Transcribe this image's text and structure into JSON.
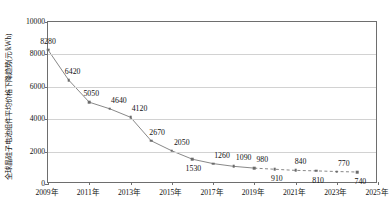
{
  "chart_data": {
    "type": "line",
    "title": "",
    "xlabel": "",
    "ylabel": "全球晶硅子电池组件平均价格下降趋势(元/kWh)",
    "ylim": [
      0,
      10000
    ],
    "xlim": [
      2009,
      2025
    ],
    "grid": true,
    "legend": "none",
    "y_ticks": [
      "0",
      "2000",
      "4000",
      "6000",
      "8000",
      "10000"
    ],
    "y_tick_values": [
      0,
      2000,
      4000,
      6000,
      8000,
      10000
    ],
    "x_ticks": [
      "2009年",
      "2011年",
      "2013年",
      "2015年",
      "2017年",
      "2019年",
      "2021年",
      "2023年",
      "2025年"
    ],
    "x_tick_values": [
      2009,
      2011,
      2013,
      2015,
      2017,
      2019,
      2021,
      2023,
      2025
    ],
    "x": [
      2009,
      2010,
      2011,
      2012,
      2013,
      2014,
      2015,
      2016,
      2017,
      2018,
      2019,
      2020,
      2021,
      2022,
      2023,
      2024
    ],
    "values": [
      8280,
      6420,
      5050,
      4640,
      4120,
      2670,
      2050,
      1530,
      1260,
      1090,
      980,
      910,
      840,
      810,
      770,
      740
    ],
    "point_labels": [
      "8280",
      "6420",
      "5050",
      "4640",
      "4120",
      "2670",
      "2050",
      "1530",
      "1260",
      "1090",
      "980",
      "910",
      "840",
      "810",
      "770",
      "740"
    ],
    "label_offsets": [
      [
        0,
        -9
      ],
      [
        4,
        -9
      ],
      [
        2,
        -9
      ],
      [
        9,
        -9
      ],
      [
        9,
        -9
      ],
      [
        6,
        -9
      ],
      [
        10,
        -9
      ],
      [
        1,
        9
      ],
      [
        9,
        -9
      ],
      [
        10,
        -9
      ],
      [
        8,
        -9
      ],
      [
        2,
        9
      ],
      [
        5,
        -9
      ],
      [
        2,
        9
      ],
      [
        7,
        -9
      ],
      [
        3,
        9
      ]
    ],
    "solid_segment_end_index": 10,
    "dashed_from_index": 10,
    "series_color": "#7a7a7a",
    "marker_color": "#6b6b6b",
    "grid_color": "#d2d2d2",
    "axis_color": "#6e6e6e",
    "text_color": "#111111",
    "background": "#ffffff"
  }
}
